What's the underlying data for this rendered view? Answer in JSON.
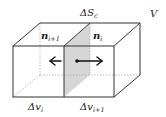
{
  "diagram": {
    "labels": {
      "volume": "V",
      "shared_face": {
        "main": "ΔS",
        "sub": "c"
      },
      "normal_left": {
        "main": "n",
        "sub": "i+1"
      },
      "normal_right": {
        "main": "n",
        "sub": "i"
      },
      "cell_left": {
        "main": "Δv",
        "sub": "i"
      },
      "cell_right": {
        "main": "Δv",
        "sub": "i+1"
      }
    },
    "colors": {
      "edge": "#333333",
      "hidden_edge": "#aaaaaa",
      "shared_face_fill": "#d6d6d6",
      "arrow": "#111111"
    },
    "arrows": [
      {
        "name": "normal-left-arrow",
        "direction": "left"
      },
      {
        "name": "normal-right-arrow",
        "direction": "right"
      }
    ]
  }
}
